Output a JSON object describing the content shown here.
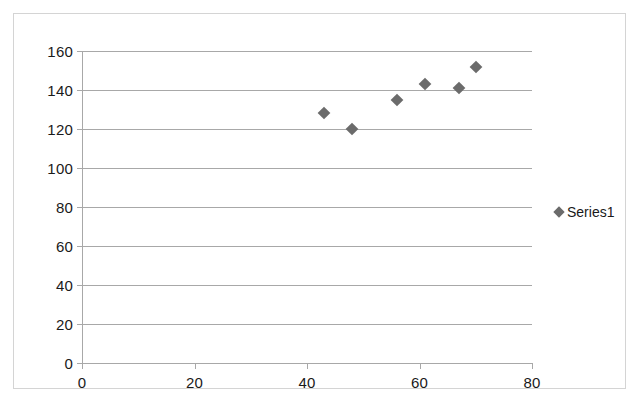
{
  "chart_data": {
    "type": "scatter",
    "title": "",
    "xlabel": "",
    "ylabel": "",
    "xlim": [
      0,
      80
    ],
    "ylim": [
      0,
      160
    ],
    "xticks": [
      0,
      20,
      40,
      60,
      80
    ],
    "yticks": [
      0,
      20,
      40,
      60,
      80,
      100,
      120,
      140,
      160
    ],
    "grid": "horizontal",
    "legend_position": "right",
    "series": [
      {
        "name": "Series1",
        "marker": "diamond",
        "color": "#6b6b6b",
        "points": [
          {
            "x": 43,
            "y": 128
          },
          {
            "x": 48,
            "y": 120
          },
          {
            "x": 56,
            "y": 135
          },
          {
            "x": 61,
            "y": 143
          },
          {
            "x": 67,
            "y": 141
          },
          {
            "x": 70,
            "y": 152
          }
        ]
      }
    ]
  },
  "legend": {
    "entries": [
      {
        "label": "Series1"
      }
    ]
  },
  "colors": {
    "marker": "#6b6b6b",
    "gridline": "#a8a8a8",
    "border": "#d4d4d4",
    "text": "#1a1a1a"
  }
}
